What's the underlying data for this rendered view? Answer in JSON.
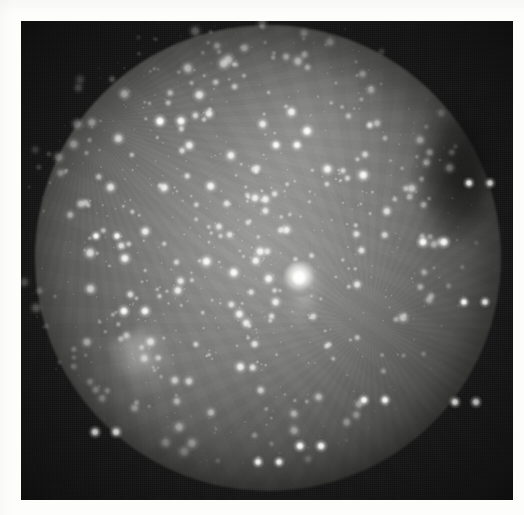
{
  "figure": {
    "kind": "astronomical-photograph",
    "medium": "monochrome photographic plate",
    "caption": "",
    "has_text_annotations": false
  },
  "frame": {
    "plate": {
      "x": 21,
      "y": 21,
      "width": 492,
      "height": 479
    },
    "page": {
      "width": 524,
      "height": 515
    },
    "margin_color": "#fdfdfc",
    "plate_background_color": "#141414"
  },
  "field_of_view": {
    "shape": "circle",
    "center_x": 247,
    "center_y": 237,
    "radius": 233,
    "vignetting": "strong",
    "peak_brightness_hex": "#969694",
    "edge_brightness_hex": "#1a1a1a"
  },
  "comet": {
    "label": "comet",
    "coma_center_x": 279,
    "coma_center_y": 258,
    "coma_radius": 17,
    "core_color": "#ffffff",
    "tail_direction": "south-southeast",
    "tail_length": 120,
    "tail_opacity": 0.5
  },
  "features": [
    {
      "name": "nebulous-patch-upper-center",
      "x": 285,
      "y": 113,
      "width": 170,
      "height": 150,
      "brightness": 0.26
    },
    {
      "name": "nebulous-patch-mid-left",
      "x": 250,
      "y": 245,
      "width": 200,
      "height": 230,
      "brightness": 0.16
    },
    {
      "name": "nebulous-patch-lower-left",
      "x": 145,
      "y": 360,
      "width": 170,
      "height": 160,
      "brightness": 0.14
    },
    {
      "name": "bright-star-knot-lower-left",
      "x": 127,
      "y": 338,
      "width": 62,
      "height": 64,
      "brightness": 0.42
    },
    {
      "name": "dark-notch-right-edge",
      "x": 433,
      "y": 155,
      "width": 70,
      "height": 130,
      "brightness": 0.0
    }
  ],
  "starfield": {
    "count": 720,
    "color": "#ffffff",
    "min_radius": 0.5,
    "max_radius": 3.6,
    "seed": 20240917,
    "bright_stars": [
      {
        "x": 160,
        "y": 100,
        "r": 3.4
      },
      {
        "x": 96,
        "y": 215,
        "r": 2.6
      },
      {
        "x": 124,
        "y": 290,
        "r": 3.2
      },
      {
        "x": 95,
        "y": 411,
        "r": 3.1
      },
      {
        "x": 276,
        "y": 124,
        "r": 3.0
      },
      {
        "x": 300,
        "y": 425,
        "r": 3.1
      },
      {
        "x": 364,
        "y": 379,
        "r": 2.9
      },
      {
        "x": 423,
        "y": 221,
        "r": 3.3
      },
      {
        "x": 469,
        "y": 162,
        "r": 2.8
      },
      {
        "x": 455,
        "y": 381,
        "r": 3.0
      },
      {
        "x": 464,
        "y": 281,
        "r": 2.7
      },
      {
        "x": 258,
        "y": 441,
        "r": 2.8
      }
    ]
  },
  "render": {
    "grain_opacity": 0.3,
    "blur_px": 1.2
  }
}
